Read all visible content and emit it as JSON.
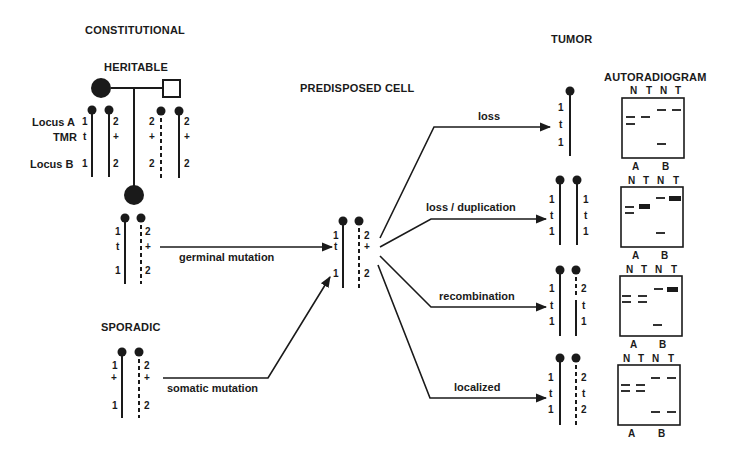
{
  "headers": {
    "constitutional": "CONSTITUTIONAL",
    "heritable": "HERITABLE",
    "sporadic": "SPORADIC",
    "predisposed_cell": "PREDISPOSED CELL",
    "tumor": "TUMOR",
    "autoradiogram": "AUTORADIOGRAM"
  },
  "pedigree": {
    "row_labels": [
      "Locus A",
      "TMR",
      "Locus B"
    ],
    "parent_chromosomes": [
      {
        "values": [
          "1",
          "t",
          "1"
        ],
        "style": "solid"
      },
      {
        "values": [
          "2",
          "+",
          "2"
        ],
        "style": "solid"
      },
      {
        "values": [
          "2",
          "+",
          "2"
        ],
        "style": "dashed"
      },
      {
        "values": [
          "2",
          "+",
          "2"
        ],
        "style": "solid"
      }
    ]
  },
  "heritable_child": {
    "chromosomes": [
      {
        "values": [
          "1",
          "t",
          "1"
        ],
        "style": "solid"
      },
      {
        "values": [
          "2",
          "+",
          "2"
        ],
        "style": "dashed"
      }
    ]
  },
  "sporadic_cell": {
    "chromosomes": [
      {
        "values": [
          "1",
          "+",
          "1"
        ],
        "style": "solid"
      },
      {
        "values": [
          "2",
          "+",
          "2"
        ],
        "style": "dashed"
      }
    ]
  },
  "predisposed": {
    "chromosomes": [
      {
        "values": [
          "1",
          "t",
          "1"
        ],
        "style": "solid"
      },
      {
        "values": [
          "2",
          "+",
          "2"
        ],
        "style": "dashed"
      }
    ]
  },
  "arrows": {
    "germinal": "germinal mutation",
    "somatic": "somatic mutation"
  },
  "mechanisms": [
    {
      "label": "loss",
      "tumor": [
        {
          "values": [
            "1",
            "t",
            "1"
          ],
          "style": "solid"
        }
      ]
    },
    {
      "label": "loss / duplication",
      "tumor": [
        {
          "values": [
            "1",
            "t",
            "1"
          ],
          "style": "solid"
        },
        {
          "values": [
            "1",
            "t",
            "1"
          ],
          "style": "solid"
        }
      ]
    },
    {
      "label": "recombination",
      "tumor": [
        {
          "values": [
            "1",
            "t",
            "1"
          ],
          "style": "solid"
        },
        {
          "values": [
            "2",
            "t",
            "1"
          ],
          "style": "recombinant"
        }
      ]
    },
    {
      "label": "localized",
      "tumor": [
        {
          "values": [
            "1",
            "t",
            "1"
          ],
          "style": "solid"
        },
        {
          "values": [
            "2",
            "t",
            "2"
          ],
          "style": "dashed"
        }
      ]
    }
  ],
  "autoradiogram": {
    "lane_labels": [
      "N",
      "T",
      "N",
      "T"
    ],
    "locus_labels": [
      "A",
      "B"
    ]
  }
}
